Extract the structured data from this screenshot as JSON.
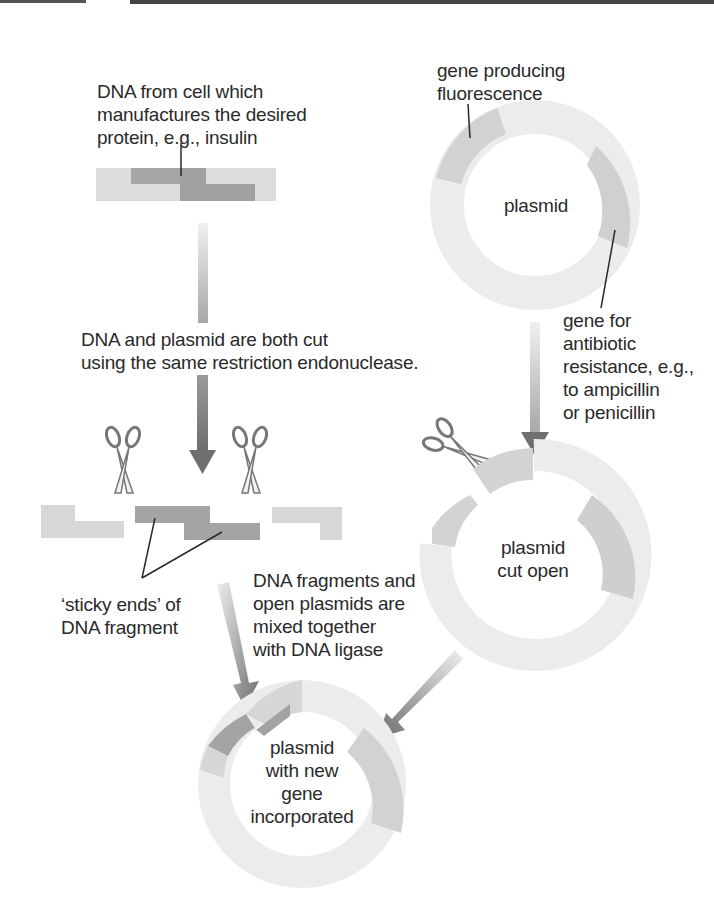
{
  "labels": {
    "source_dna": "DNA from cell which\nmanufactures the desired\nprotein, e.g., insulin",
    "fluorescence_gene": "gene producing\nfluorescence",
    "plasmid": "plasmid",
    "antibiotic_gene": "gene for\nantibiotic\nresistance, e.g.,\nto ampicillin\nor penicillin",
    "cut_step": "DNA and plasmid are both cut\nusing the same restriction endonuclease.",
    "sticky_ends": "‘sticky ends’ of\nDNA fragment",
    "mix_step": "DNA fragments and\nopen plasmids are\nmixed together\nwith DNA ligase",
    "plasmid_cut_open": "plasmid\ncut open",
    "recombinant_plasmid": "plasmid\nwith new\ngene\nincorporated"
  },
  "colors": {
    "light_segment": "#e6e6e6",
    "medium_segment": "#cfcfcf",
    "dark_segment": "#9a9a9a",
    "darker_segment": "#8a8a8a",
    "arrow_dark": "#7a7a7a",
    "line": "#2a2a2a"
  },
  "icons": [
    "scissors-icon",
    "scissors-icon",
    "scissors-icon"
  ]
}
